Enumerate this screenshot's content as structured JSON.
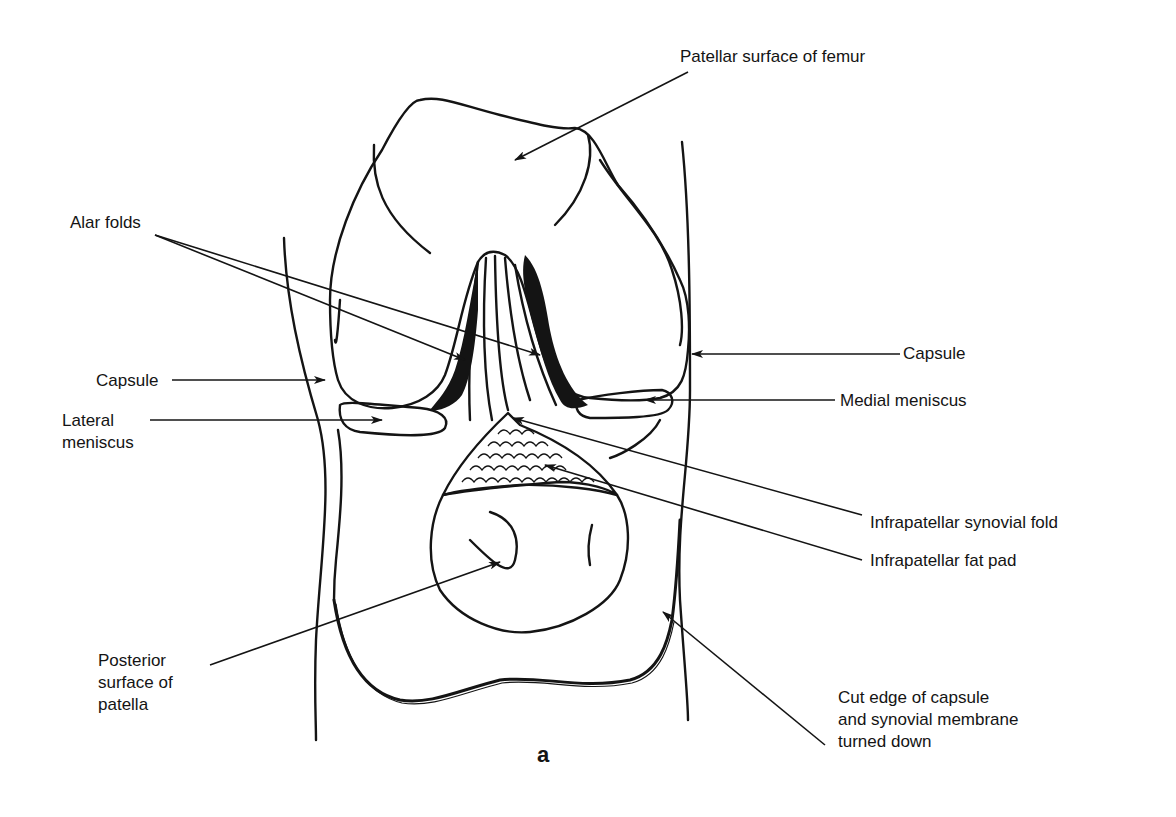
{
  "figure": {
    "caption": "a",
    "labels": {
      "patellar_surface_of_femur": "Patellar surface of femur",
      "alar_folds": "Alar folds",
      "capsule_left": "Capsule",
      "capsule_right": "Capsule",
      "lateral_meniscus": "Lateral\nmeniscus",
      "medial_meniscus": "Medial meniscus",
      "infrapatellar_synovial_fold": "Infrapatellar synovial fold",
      "infrapatellar_fat_pad": "Infrapatellar fat pad",
      "posterior_surface_of_patella": "Posterior\nsurface of\npatella",
      "cut_edge_of_capsule": "Cut edge of capsule\nand synovial membrane\nturned down"
    },
    "colors": {
      "ink": "#141414",
      "background": "#ffffff"
    }
  }
}
